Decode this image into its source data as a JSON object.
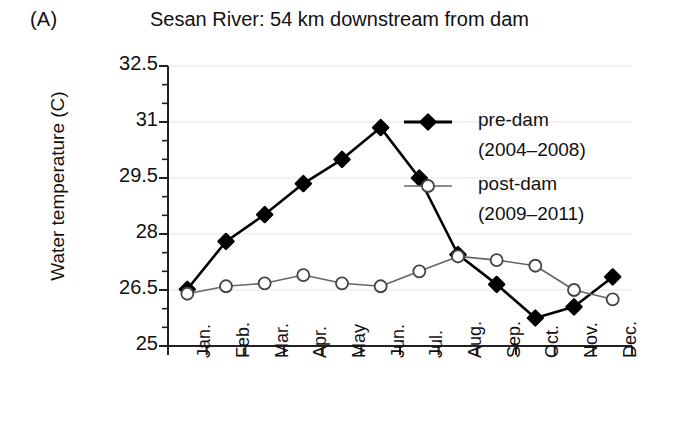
{
  "panel": {
    "label": "(A)"
  },
  "chart_data": {
    "type": "line",
    "title": "Sesan River: 54 km downstream from dam",
    "xlabel": "",
    "ylabel": "Water temperature (C)",
    "categories": [
      "Jan.",
      "Feb.",
      "Mar.",
      "Apr.",
      "May",
      "Jun.",
      "Jul.",
      "Aug.",
      "Sep.",
      "Oct.",
      "Nov.",
      "Dec."
    ],
    "ylim": [
      25,
      32.5
    ],
    "yticks": [
      "32.5",
      "31",
      "29.5",
      "28",
      "26.5",
      "25"
    ],
    "ytick_values": [
      32.5,
      31,
      29.5,
      28,
      26.5,
      25
    ],
    "minor_ticks": true,
    "grid": true,
    "legend_position": "upper-right-inside",
    "series": [
      {
        "name": "pre-dam",
        "sublabel": "(2004–2008)",
        "marker": "filled-diamond",
        "color": "#000000",
        "values": [
          26.52,
          27.8,
          28.52,
          29.35,
          30.0,
          30.85,
          29.5,
          27.45,
          26.65,
          25.75,
          26.05,
          26.85
        ]
      },
      {
        "name": "post-dam",
        "sublabel": "(2009–2011)",
        "marker": "open-circle",
        "color": "#555555",
        "values": [
          26.4,
          26.6,
          26.68,
          26.9,
          26.68,
          26.6,
          27.0,
          27.4,
          27.3,
          27.15,
          26.5,
          26.25
        ]
      }
    ]
  },
  "legend": {
    "entries": [
      {
        "label": "pre-dam",
        "sublabel": "(2004–2008)",
        "marker": "filled-diamond"
      },
      {
        "label": "post-dam",
        "sublabel": "(2009–2011)",
        "marker": "open-circle"
      }
    ]
  }
}
